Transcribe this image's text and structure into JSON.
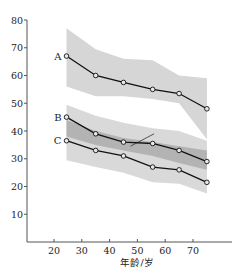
{
  "chart_data": {
    "type": "line",
    "title": "",
    "xlabel": "年龄/岁",
    "ylabel": "",
    "xlim": [
      10,
      90
    ],
    "ylim": [
      0,
      80
    ],
    "xticks": [
      20,
      30,
      40,
      50,
      60,
      70
    ],
    "yticks": [
      10,
      20,
      30,
      40,
      50,
      60,
      70,
      80
    ],
    "x": [
      24.5,
      35,
      45,
      55.5,
      65,
      75
    ],
    "series": [
      {
        "name": "A",
        "values": [
          67,
          60,
          57.5,
          55,
          53.5,
          48
        ]
      },
      {
        "name": "B",
        "values": [
          45,
          39,
          36,
          35.5,
          33,
          29
        ]
      },
      {
        "name": "C",
        "values": [
          36.5,
          33,
          31,
          27,
          26,
          21.5
        ]
      }
    ],
    "bands": [
      {
        "name": "A-range",
        "shade": "light",
        "color": "#d6d6d6",
        "upper": [
          77,
          69.5,
          66,
          65.5,
          60,
          59
        ],
        "lower": [
          56,
          52.5,
          52.5,
          51.5,
          50,
          37
        ]
      },
      {
        "name": "BC-outer-range",
        "shade": "light",
        "color": "#d9d9d9",
        "upper": [
          49.5,
          45.5,
          43,
          41,
          40,
          36.5
        ],
        "lower": [
          29.5,
          27,
          25,
          21.5,
          21,
          17.5
        ]
      },
      {
        "name": "BC-inner-range",
        "shade": "dark",
        "color": "#b3b3b3",
        "upper": [
          44,
          40,
          37.5,
          36,
          34.5,
          33
        ],
        "lower": [
          38,
          35,
          33,
          31,
          28.5,
          26
        ]
      }
    ],
    "annotation_line": {
      "from": [
        47.5,
        34.5
      ],
      "to": [
        56,
        39
      ]
    },
    "grid": false,
    "legend": "none (series labelled A, B, C at left end of lines)"
  }
}
